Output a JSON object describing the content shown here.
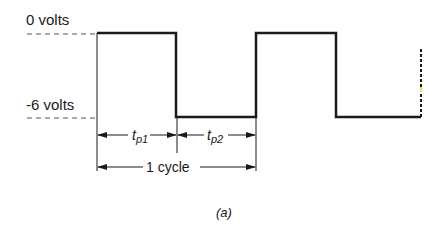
{
  "diagram": {
    "type": "square-wave-timing",
    "levels": {
      "high_label": "0 volts",
      "low_label": "-6 volts"
    },
    "pulse_labels": {
      "tp1": {
        "base": "t",
        "sub": "p1"
      },
      "tp2": {
        "base": "t",
        "sub": "p2"
      }
    },
    "cycle_label": "1 cycle",
    "caption": "(a)",
    "colors": {
      "line": "#1a1a1a",
      "dash": "#555555",
      "marker": "#e8e070"
    }
  }
}
